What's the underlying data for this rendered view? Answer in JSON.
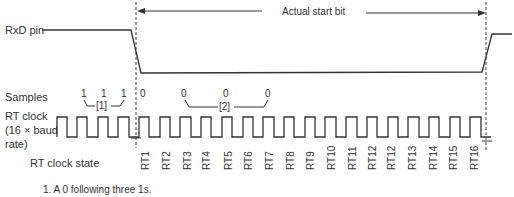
{
  "signals": {
    "rxd_label": "RxD pin",
    "samples_label": "Samples",
    "rt_clock_label_line1": "RT clock",
    "rt_clock_label_line2": "(16 × baud",
    "rt_clock_label_line3": "rate)",
    "rt_state_label": "RT clock state"
  },
  "start_bit": {
    "label": "Actual start bit"
  },
  "samples": {
    "pre": [
      "1",
      "1",
      "1"
    ],
    "first_zero": "0",
    "verify": [
      "0",
      "0",
      "0"
    ],
    "bracket1_label": "[1]",
    "bracket2_label": "[2]"
  },
  "rt_states": [
    "RT1",
    "RT2",
    "RT3",
    "RT4",
    "RT5",
    "RT6",
    "RT7",
    "RT8",
    "RT9",
    "RT10",
    "RT11",
    "RT12",
    "RT12",
    "RT13",
    "RT14",
    "RT15",
    "RT16"
  ],
  "footnote": "1. A 0 following three 1s."
}
